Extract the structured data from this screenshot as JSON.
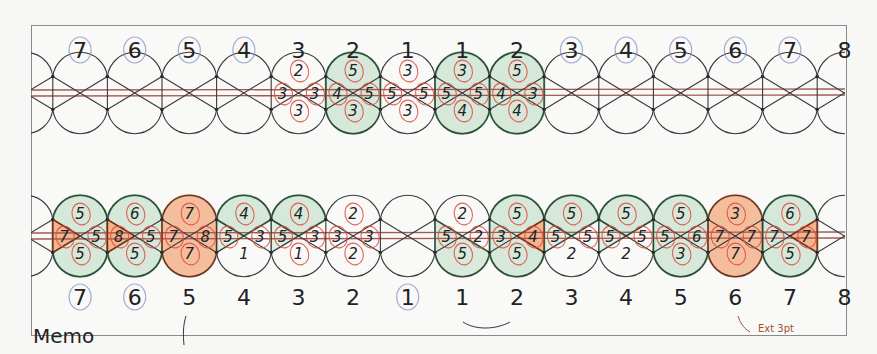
{
  "diagram": {
    "type": "braiding-chart",
    "colors": {
      "outline": "#3a3a3a",
      "green_fill": "#cfe6d4",
      "green_stroke": "#2f8a4e",
      "orange_fill": "#f4b48c",
      "orange_stroke": "#e5581c",
      "red_circle": "#e0463d",
      "blue_circle": "#8c97c9",
      "thread": "#a05a52"
    },
    "top_row": {
      "labels": [
        "8",
        "7",
        "6",
        "5",
        "4",
        "3",
        "2",
        "1",
        "1",
        "2",
        "3",
        "4",
        "5",
        "6",
        "7",
        "8"
      ],
      "circled_labels": [
        "7",
        "6",
        "5",
        "4",
        "3",
        "4",
        "5",
        "6",
        "7"
      ],
      "cells": [
        {
          "col": "3",
          "fill": "none",
          "top": "2",
          "left": "3",
          "right": "3",
          "bottom": "3"
        },
        {
          "col": "2",
          "fill": "green",
          "top": "5",
          "left": "4",
          "right": "5",
          "bottom": "3"
        },
        {
          "col": "1",
          "fill": "none",
          "top": "3",
          "left": "5",
          "right": "5",
          "bottom": "3"
        },
        {
          "col": "1",
          "fill": "green",
          "top": "3",
          "left": "5",
          "right": "5",
          "bottom": "4"
        },
        {
          "col": "2",
          "fill": "green",
          "top": "5",
          "left": "4",
          "right": "3",
          "bottom": "4"
        }
      ]
    },
    "bottom_row": {
      "labels": [
        "8",
        "7",
        "6",
        "5",
        "4",
        "3",
        "2",
        "1",
        "1",
        "2",
        "3",
        "4",
        "5",
        "6",
        "7",
        "8"
      ],
      "circled_labels": [
        "7",
        "6",
        "1"
      ],
      "cells": [
        {
          "col": "7",
          "fill": "green",
          "left_fill": "orange",
          "top": "5",
          "left": "7",
          "right": "5",
          "bottom": "5"
        },
        {
          "col": "6",
          "fill": "green",
          "left_fill": "orange",
          "top": "6",
          "left": "8",
          "right": "5",
          "bottom": "5"
        },
        {
          "col": "5",
          "fill": "orange",
          "top": "7",
          "left": "7",
          "right": "8",
          "bottom": "7"
        },
        {
          "col": "4",
          "fill": "green-top",
          "top": "4",
          "left": "5",
          "right": "3",
          "bottom": "1"
        },
        {
          "col": "3",
          "fill": "green-top",
          "top": "4",
          "left": "5",
          "right": "3",
          "bottom": "1"
        },
        {
          "col": "2",
          "fill": "none",
          "top": "2",
          "left": "3",
          "right": "3",
          "bottom": "2"
        },
        {
          "col": "1",
          "fill": "none",
          "top": "",
          "left": "",
          "right": "",
          "bottom": ""
        },
        {
          "col": "1",
          "fill": "green-left",
          "top": "2",
          "left": "5",
          "right": "2",
          "bottom": "5"
        },
        {
          "col": "2",
          "fill": "green",
          "right_fill": "orange",
          "top": "5",
          "left": "3",
          "right": "4",
          "bottom": "5"
        },
        {
          "col": "3",
          "fill": "green-top",
          "top": "5",
          "left": "5",
          "right": "5",
          "bottom": "2"
        },
        {
          "col": "4",
          "fill": "green-top",
          "top": "5",
          "left": "5",
          "right": "5",
          "bottom": "2"
        },
        {
          "col": "5",
          "fill": "green",
          "top": "5",
          "left": "5",
          "right": "6",
          "bottom": "3"
        },
        {
          "col": "6",
          "fill": "orange",
          "top": "3",
          "left": "7",
          "right": "7",
          "bottom": "7"
        },
        {
          "col": "7",
          "fill": "green",
          "right_fill": "orange",
          "top": "6",
          "left": "7",
          "right": "7",
          "bottom": "5"
        }
      ]
    },
    "memo_label": "Memo",
    "margin_note": "Ext 3pt"
  }
}
